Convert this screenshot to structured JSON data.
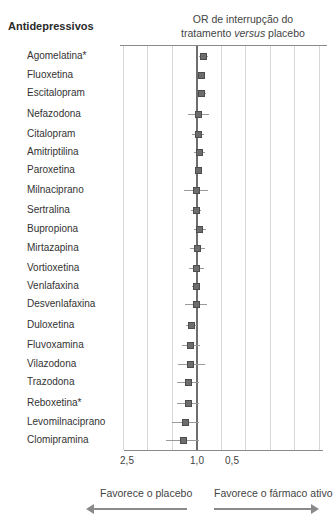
{
  "heading": "Antidepressivos",
  "title_line1": "OR de interrupção do",
  "title_line2_pre": "tratamento ",
  "title_line2_italic": "versus",
  "title_line2_post": " placebo",
  "axis_ticks": [
    {
      "label": "2,5",
      "x": 127
    },
    {
      "label": "1,0",
      "x": 197
    },
    {
      "label": "0,5",
      "x": 232
    }
  ],
  "favors_left": "Favorece o placebo",
  "favors_right": "Favorece o fármaco ativo",
  "colors": {
    "marker": "#6d6d6d",
    "axis": "#6e6e6e",
    "grid": "#d8d8d8"
  },
  "chart_data": {
    "type": "scatter",
    "subtype": "forest-plot",
    "title": "OR de interrupção do tratamento versus placebo",
    "ylabel": "Antidepressivos",
    "xlabel": "",
    "x_ticks": [
      "2,5",
      "1,0",
      "0,5"
    ],
    "x_reversed": true,
    "reference_line": 1.0,
    "grid": true,
    "categories": [
      "Agomelatina*",
      "Fluoxetina",
      "Escitalopram",
      "Nefazodona",
      "Citalopram",
      "Amitriptilina",
      "Paroxetina",
      "Milnaciprano",
      "Sertralina",
      "Bupropiona",
      "Mirtazapina",
      "Vortioxetina",
      "Venlafaxina",
      "Desvenlafaxina",
      "Duloxetina",
      "Fluvoxamina",
      "Vilazodona",
      "Trazodona",
      "Reboxetina*",
      "Levomilnaciprano",
      "Clomipramina"
    ],
    "series": [
      {
        "name": "OR",
        "values": [
          0.86,
          0.88,
          0.88,
          0.97,
          0.97,
          0.9,
          0.95,
          0.97,
          0.98,
          0.96,
          0.94,
          0.96,
          0.96,
          0.97,
          1.1,
          1.12,
          1.12,
          1.16,
          1.16,
          1.23,
          1.27
        ]
      },
      {
        "name": "CI_low",
        "values": [
          0.78,
          0.83,
          0.81,
          0.79,
          0.88,
          0.82,
          0.9,
          0.78,
          0.88,
          0.86,
          0.84,
          0.86,
          0.88,
          0.85,
          1.0,
          1.01,
          0.99,
          1.04,
          1.04,
          1.05,
          1.08
        ]
      },
      {
        "name": "CI_high",
        "values": [
          0.93,
          0.93,
          0.94,
          1.15,
          1.06,
          0.98,
          1.0,
          1.15,
          1.08,
          1.06,
          1.04,
          1.06,
          1.04,
          1.09,
          1.19,
          1.21,
          1.24,
          1.28,
          1.28,
          1.42,
          1.46
        ]
      }
    ]
  },
  "rows": [
    {
      "label": "Agomelatina*",
      "y": 56,
      "x": 203,
      "lo": 199,
      "hi": 208
    },
    {
      "label": "Fluoxetina",
      "y": 75,
      "x": 201,
      "lo": 199,
      "hi": 204
    },
    {
      "label": "Escitalopram",
      "y": 93,
      "x": 201,
      "lo": 198,
      "hi": 206
    },
    {
      "label": "Nefazodona",
      "y": 114,
      "x": 198,
      "lo": 188,
      "hi": 209
    },
    {
      "label": "Citalopram",
      "y": 134,
      "x": 198,
      "lo": 192,
      "hi": 204
    },
    {
      "label": "Amitriptilina",
      "y": 152,
      "x": 199,
      "lo": 194,
      "hi": 205
    },
    {
      "label": "Paroxetina",
      "y": 170,
      "x": 198,
      "lo": 196,
      "hi": 201
    },
    {
      "label": "Milnaciprano",
      "y": 190,
      "x": 196,
      "lo": 184,
      "hi": 208
    },
    {
      "label": "Sertralina",
      "y": 210,
      "x": 196,
      "lo": 191,
      "hi": 201
    },
    {
      "label": "Bupropiona",
      "y": 229,
      "x": 199,
      "lo": 194,
      "hi": 206
    },
    {
      "label": "Mirtazapina",
      "y": 248,
      "x": 197,
      "lo": 190,
      "hi": 205
    },
    {
      "label": "Vortioxetina",
      "y": 268,
      "x": 196,
      "lo": 189,
      "hi": 204
    },
    {
      "label": "Venlafaxina",
      "y": 286,
      "x": 196,
      "lo": 192,
      "hi": 200
    },
    {
      "label": "Desvenlafaxina",
      "y": 304,
      "x": 196,
      "lo": 185,
      "hi": 207
    },
    {
      "label": "Duloxetina",
      "y": 325,
      "x": 191,
      "lo": 186,
      "hi": 197
    },
    {
      "label": "Fluvoxamina",
      "y": 345,
      "x": 190,
      "lo": 182,
      "hi": 200
    },
    {
      "label": "Vilazodona",
      "y": 364,
      "x": 190,
      "lo": 178,
      "hi": 205
    },
    {
      "label": "Trazodona",
      "y": 382,
      "x": 188,
      "lo": 177,
      "hi": 199
    },
    {
      "label": "Reboxetina*",
      "y": 403,
      "x": 188,
      "lo": 177,
      "hi": 199
    },
    {
      "label": "Levomilnaciprano",
      "y": 422,
      "x": 185,
      "lo": 172,
      "hi": 199
    },
    {
      "label": "Clomipramina",
      "y": 440,
      "x": 183,
      "lo": 166,
      "hi": 199
    }
  ],
  "gridlines_x": [
    123,
    147,
    172,
    221,
    245,
    270,
    294,
    319
  ]
}
